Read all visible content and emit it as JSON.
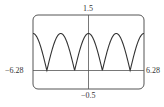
{
  "chart_data": {
    "type": "line",
    "title": "",
    "xlabel": "",
    "ylabel": "",
    "function": "y = |cos x|",
    "xlim": [
      -6.28,
      6.28
    ],
    "ylim": [
      -0.5,
      1.5
    ],
    "grid": false,
    "legend": null,
    "tick_labels": {
      "x_min": "−6.28",
      "x_max": "6.28",
      "y_max": "1.5",
      "y_min": "−0.5"
    },
    "series": [
      {
        "name": "|cos x|",
        "x": [
          -6.28,
          -4.71,
          -3.14,
          -1.57,
          0,
          1.57,
          3.14,
          4.71,
          6.28
        ],
        "values": [
          1,
          0,
          1,
          0,
          1,
          0,
          1,
          0,
          1
        ]
      }
    ]
  }
}
